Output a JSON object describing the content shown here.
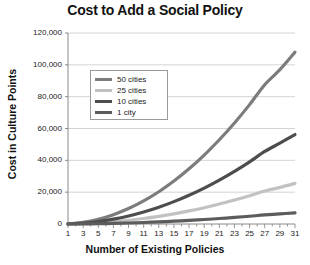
{
  "chart_data": {
    "type": "line",
    "title": "Cost to Add a Social Policy",
    "xlabel": "Number of Existing Policies",
    "ylabel": "Cost in Culture Points",
    "grid": true,
    "legend_position": "upper-left-inside",
    "xlim": [
      1,
      31
    ],
    "ylim": [
      0,
      120000
    ],
    "yticks": [
      0,
      20000,
      40000,
      60000,
      80000,
      100000,
      120000
    ],
    "ytick_labels": [
      "0",
      "20,000",
      "40,000",
      "60,000",
      "80,000",
      "100,000",
      "120,000"
    ],
    "xticks": [
      1,
      3,
      5,
      7,
      9,
      11,
      13,
      15,
      17,
      19,
      21,
      23,
      25,
      27,
      29,
      31
    ],
    "xtick_labels": [
      "1",
      "3",
      "5",
      "7",
      "9",
      "11",
      "13",
      "15",
      "17",
      "19",
      "21",
      "23",
      "25",
      "27",
      "29",
      "31"
    ],
    "x": [
      1,
      3,
      5,
      7,
      9,
      11,
      13,
      15,
      17,
      19,
      21,
      23,
      25,
      27,
      29,
      31
    ],
    "series": [
      {
        "name": "50 cities",
        "color": "#7c7c7c",
        "width": 3.2,
        "values": [
          120,
          1080,
          3000,
          5880,
          9720,
          14520,
          20280,
          27000,
          34680,
          43320,
          52920,
          63480,
          75000,
          87480,
          96960,
          108000
        ]
      },
      {
        "name": "25 cities",
        "color": "#c2c2c2",
        "width": 3.2,
        "values": [
          30,
          255,
          710,
          1390,
          2300,
          3440,
          4800,
          6390,
          8210,
          10250,
          12530,
          15030,
          17760,
          20720,
          23000,
          25500
        ]
      },
      {
        "name": "10 cities",
        "color": "#4d4d4d",
        "width": 3.2,
        "values": [
          62,
          560,
          1560,
          3060,
          5060,
          7560,
          10560,
          14060,
          18060,
          22560,
          27560,
          33060,
          39060,
          45560,
          50800,
          56200
        ]
      },
      {
        "name": "1 city",
        "color": "#5c5c5c",
        "width": 3.2,
        "values": [
          8,
          70,
          195,
          382,
          632,
          945,
          1320,
          1757,
          2257,
          2820,
          3445,
          4132,
          4882,
          5695,
          6350,
          7000
        ]
      }
    ]
  },
  "legend": {
    "entries": [
      {
        "label": "50 cities",
        "color": "#7c7c7c"
      },
      {
        "label": "25 cities",
        "color": "#c2c2c2"
      },
      {
        "label": "10 cities",
        "color": "#4d4d4d"
      },
      {
        "label": "1 city",
        "color": "#5c5c5c"
      }
    ]
  }
}
